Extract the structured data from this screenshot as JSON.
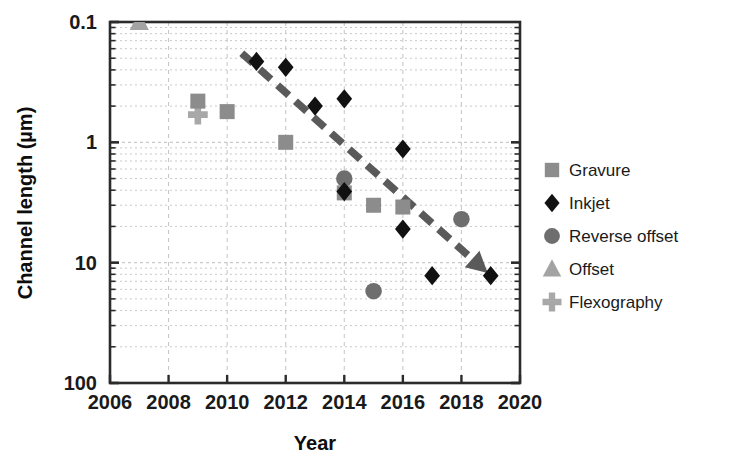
{
  "chart_data": {
    "type": "scatter",
    "title": "",
    "subtitle": "",
    "xlabel": "Year",
    "ylabel": "Channel length (µm)",
    "xlim": [
      2006,
      2020
    ],
    "ylim": [
      0.1,
      100
    ],
    "yscale": "log",
    "xticks": [
      "2006",
      "2008",
      "2010",
      "2012",
      "2014",
      "2016",
      "2018",
      "2020"
    ],
    "xtick_values": [
      2006,
      2008,
      2010,
      2012,
      2014,
      2016,
      2018,
      2020
    ],
    "yticks": [
      "0.1",
      "1",
      "10",
      "100"
    ],
    "ytick_values": [
      0.1,
      1,
      10,
      100
    ],
    "grid": true,
    "grid_style": "dotted-minor-log",
    "legend_position": "right",
    "series": [
      {
        "name": "Gravure",
        "marker": "square",
        "color": "#8c8c8c",
        "points": [
          {
            "x": 2009,
            "y": 22
          },
          {
            "x": 2010,
            "y": 18
          },
          {
            "x": 2012,
            "y": 10
          },
          {
            "x": 2014,
            "y": 3.8
          },
          {
            "x": 2015,
            "y": 3.0
          },
          {
            "x": 2016,
            "y": 2.9
          }
        ]
      },
      {
        "name": "Inkjet",
        "marker": "diamond",
        "color": "#111111",
        "points": [
          {
            "x": 2011,
            "y": 47
          },
          {
            "x": 2012,
            "y": 42
          },
          {
            "x": 2013,
            "y": 20
          },
          {
            "x": 2014,
            "y": 23
          },
          {
            "x": 2014,
            "y": 3.9
          },
          {
            "x": 2016,
            "y": 8.8
          },
          {
            "x": 2016,
            "y": 1.9
          },
          {
            "x": 2017,
            "y": 0.78
          },
          {
            "x": 2019,
            "y": 0.78
          }
        ]
      },
      {
        "name": "Reverse offset",
        "marker": "circle",
        "color": "#6e6e6e",
        "points": [
          {
            "x": 2014,
            "y": 5.0
          },
          {
            "x": 2015,
            "y": 0.58
          },
          {
            "x": 2018,
            "y": 2.3
          }
        ]
      },
      {
        "name": "Offset",
        "marker": "triangle",
        "color": "#a3a3a3",
        "points": [
          {
            "x": 2007,
            "y": 100
          }
        ]
      },
      {
        "name": "Flexography",
        "marker": "plus",
        "color": "#a8a8a8",
        "points": [
          {
            "x": 2009,
            "y": 17
          }
        ]
      }
    ],
    "annotations": [
      {
        "type": "trend-arrow",
        "style": "dashed",
        "color": "#5a5a5a",
        "from": {
          "x": 2010.5,
          "y": 55
        },
        "to": {
          "x": 2018.9,
          "y": 0.82
        },
        "label": ""
      }
    ]
  },
  "axes": {
    "y_title": "Channel length (µm)",
    "x_title": "Year",
    "y_tick_labels": [
      "100",
      "10",
      "1",
      "0.1"
    ],
    "x_tick_labels": [
      "2006",
      "2008",
      "2010",
      "2012",
      "2014",
      "2016",
      "2018",
      "2020"
    ]
  },
  "legend": {
    "items": [
      {
        "label": "Gravure",
        "marker": "square-marker-icon",
        "color": "#8c8c8c"
      },
      {
        "label": "Inkjet",
        "marker": "diamond-marker-icon",
        "color": "#111111"
      },
      {
        "label": "Reverse offset",
        "marker": "circle-marker-icon",
        "color": "#6e6e6e"
      },
      {
        "label": "Offset",
        "marker": "triangle-marker-icon",
        "color": "#a3a3a3"
      },
      {
        "label": "Flexography",
        "marker": "plus-marker-icon",
        "color": "#a8a8a8"
      }
    ]
  }
}
